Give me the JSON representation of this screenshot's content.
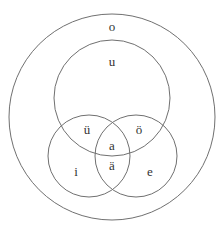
{
  "diagram": {
    "type": "nested-venn",
    "stroke_color": "#707070",
    "text_color": "#333333",
    "circles": [
      {
        "id": "outer",
        "cx": 112,
        "cy": 117,
        "r": 103
      },
      {
        "id": "upper",
        "cx": 112,
        "cy": 98,
        "r": 58
      },
      {
        "id": "lower-left",
        "cx": 89,
        "cy": 156,
        "r": 41
      },
      {
        "id": "lower-right",
        "cx": 136,
        "cy": 156,
        "r": 41
      }
    ],
    "labels": {
      "outer": "o",
      "upper": "u",
      "upper_left_overlap": "ü",
      "upper_right_overlap": "ö",
      "center": "a",
      "lower_overlap": "ä",
      "lower_left": "i",
      "lower_right": "e"
    }
  }
}
